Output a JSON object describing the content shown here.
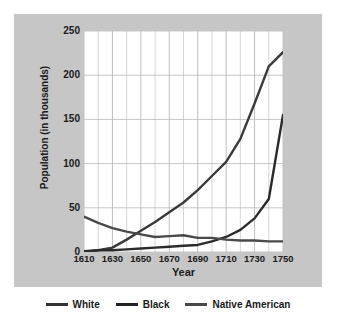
{
  "chart_data": {
    "type": "line",
    "title": "",
    "xlabel": "Year",
    "ylabel": "Population (in thousands)",
    "x": [
      1610,
      1620,
      1630,
      1640,
      1650,
      1660,
      1670,
      1680,
      1690,
      1700,
      1710,
      1720,
      1730,
      1740,
      1750
    ],
    "xlim": [
      1610,
      1750
    ],
    "ylim": [
      0,
      250
    ],
    "xticks": [
      "1610",
      "1630",
      "1650",
      "1670",
      "1690",
      "1710",
      "1730",
      "1750"
    ],
    "yticks": [
      "0",
      "50",
      "100",
      "150",
      "200",
      "250"
    ],
    "grid": true,
    "legend_position": "bottom",
    "series": [
      {
        "name": "White",
        "color": "#3a3a3a",
        "values": [
          0,
          2,
          5,
          14,
          24,
          34,
          45,
          56,
          70,
          86,
          102,
          128,
          168,
          210,
          226
        ]
      },
      {
        "name": "Black",
        "color": "#2b2b2b",
        "values": [
          1,
          2,
          2,
          3,
          4,
          5,
          6,
          7,
          8,
          12,
          17,
          25,
          38,
          60,
          155
        ]
      },
      {
        "name": "Native American",
        "color": "#4a4a4a",
        "values": [
          40,
          33,
          27,
          23,
          20,
          17,
          18,
          19,
          16,
          16,
          14,
          13,
          13,
          12,
          12
        ]
      }
    ]
  },
  "legend": {
    "items": [
      {
        "label": "White",
        "color": "#333333"
      },
      {
        "label": "Black",
        "color": "#222222"
      },
      {
        "label": "Native American",
        "color": "#4a4a4a"
      }
    ]
  }
}
